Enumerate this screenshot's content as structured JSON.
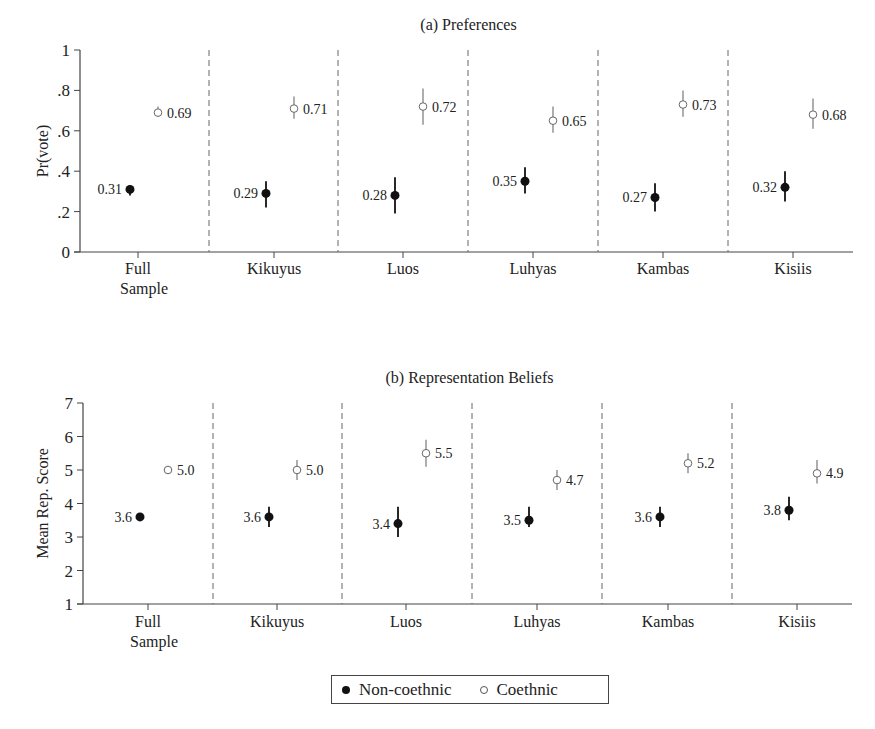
{
  "chart_data": [
    {
      "type": "scatter",
      "title": "(a) Preferences",
      "xlabel": "",
      "ylabel": "Pr(vote)",
      "ylim": [
        0,
        1
      ],
      "yticks": [
        0,
        0.2,
        0.4,
        0.6,
        0.8,
        1
      ],
      "ytick_labels": [
        "0",
        ".2",
        ".4",
        ".6",
        ".8",
        "1"
      ],
      "categories": [
        "Full Sample",
        "Kikuyus",
        "Luos",
        "Luhyas",
        "Kambas",
        "Kisiis"
      ],
      "grid": false,
      "series": [
        {
          "name": "Non-coethnic",
          "marker": "filled",
          "values": [
            0.31,
            0.29,
            0.28,
            0.35,
            0.27,
            0.32
          ],
          "labels": [
            "0.31",
            "0.29",
            "0.28",
            "0.35",
            "0.27",
            "0.32"
          ],
          "ci_low": [
            0.28,
            0.22,
            0.19,
            0.29,
            0.2,
            0.25
          ],
          "ci_high": [
            0.33,
            0.35,
            0.37,
            0.42,
            0.34,
            0.4
          ]
        },
        {
          "name": "Coethnic",
          "marker": "open",
          "values": [
            0.69,
            0.71,
            0.72,
            0.65,
            0.73,
            0.68
          ],
          "labels": [
            "0.69",
            "0.71",
            "0.72",
            "0.65",
            "0.73",
            "0.68"
          ],
          "ci_low": [
            0.67,
            0.66,
            0.63,
            0.59,
            0.67,
            0.61
          ],
          "ci_high": [
            0.72,
            0.77,
            0.81,
            0.72,
            0.8,
            0.76
          ]
        }
      ]
    },
    {
      "type": "scatter",
      "title": "(b) Representation Beliefs",
      "xlabel": "",
      "ylabel": "Mean Rep. Score",
      "ylim": [
        1,
        7
      ],
      "yticks": [
        1,
        2,
        3,
        4,
        5,
        6,
        7
      ],
      "ytick_labels": [
        "1",
        "2",
        "3",
        "4",
        "5",
        "6",
        "7"
      ],
      "categories": [
        "Full Sample",
        "Kikuyus",
        "Luos",
        "Luhyas",
        "Kambas",
        "Kisiis"
      ],
      "grid": false,
      "series": [
        {
          "name": "Non-coethnic",
          "marker": "filled",
          "values": [
            3.6,
            3.6,
            3.4,
            3.5,
            3.6,
            3.8
          ],
          "labels": [
            "3.6",
            "3.6",
            "3.4",
            "3.5",
            "3.6",
            "3.8"
          ],
          "ci_low": [
            3.5,
            3.3,
            3.0,
            3.3,
            3.3,
            3.5
          ],
          "ci_high": [
            3.7,
            3.9,
            3.9,
            3.9,
            3.9,
            4.2
          ]
        },
        {
          "name": "Coethnic",
          "marker": "open",
          "values": [
            5.0,
            5.0,
            5.5,
            4.7,
            5.2,
            4.9
          ],
          "labels": [
            "5.0",
            "5.0",
            "5.5",
            "4.7",
            "5.2",
            "4.9"
          ],
          "ci_low": [
            4.9,
            4.7,
            5.1,
            4.4,
            4.9,
            4.6
          ],
          "ci_high": [
            5.1,
            5.3,
            5.9,
            5.0,
            5.5,
            5.3
          ]
        }
      ]
    }
  ],
  "legend": {
    "items": [
      {
        "label": "Non-coethnic",
        "marker": "filled"
      },
      {
        "label": "Coethnic",
        "marker": "open"
      }
    ]
  }
}
